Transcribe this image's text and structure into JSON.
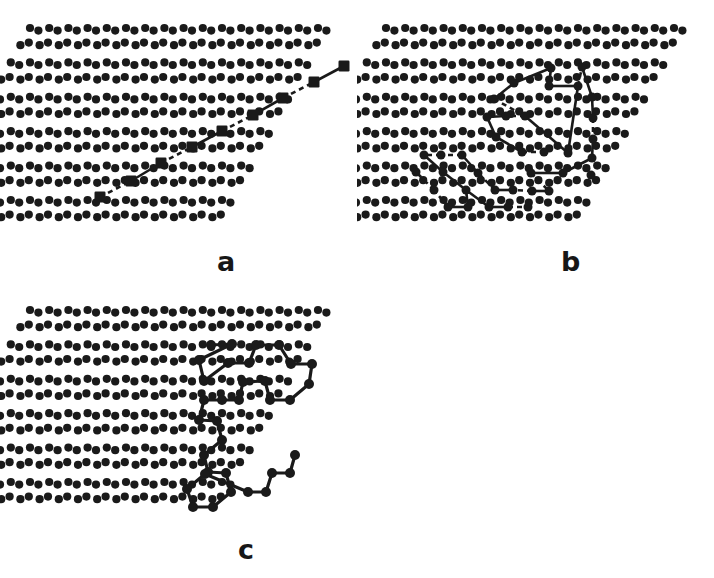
{
  "figure": {
    "background_color": "#ffffff",
    "ink_color": "#1a1a1a",
    "width": 714,
    "height": 578,
    "panel_count": 3
  },
  "lattice": {
    "type": "honeycomb-paired-dot",
    "dot_radius": 4.1,
    "row_spacing": 17.2,
    "column_spacing": 19.2,
    "shear_per_row": -9.6,
    "dot_color": "#1a1a1a"
  },
  "panels": [
    {
      "id": "a",
      "label": "a",
      "label_x": 217,
      "label_y": 248,
      "origin_x": 30,
      "origin_y": 28,
      "rows": 12,
      "cols": 16,
      "description": "Straight diagonal chain of square sites (rod-like conformation)",
      "marker_shape": "square",
      "marker_size": 11,
      "bond_pattern": "alternating-solid-dashed",
      "chain_site_count": 9,
      "chain_points": [
        [
          100,
          197
        ],
        [
          131,
          181
        ],
        [
          161,
          163
        ],
        [
          192,
          147
        ],
        [
          222,
          131
        ],
        [
          253,
          115
        ],
        [
          283,
          98
        ],
        [
          314,
          82
        ],
        [
          344,
          66
        ]
      ],
      "bond_styles": [
        "dashed",
        "solid",
        "dashed",
        "solid",
        "dashed",
        "solid",
        "dashed",
        "solid"
      ]
    },
    {
      "id": "b",
      "label": "b",
      "label_x": 561,
      "label_y": 248,
      "origin_x": 386,
      "origin_y": 28,
      "rows": 12,
      "cols": 16,
      "description": "Compact collapsed cluster: several closed loops of occupied sites with mixed solid and dashed bonds",
      "marker_shape": "circle",
      "marker_size": 9,
      "bond_pattern": "mixed-solid-dashed",
      "chain_site_count": 38,
      "nodes": [
        [
          551,
          68
        ],
        [
          514,
          83
        ],
        [
          494,
          99
        ],
        [
          549,
          86
        ],
        [
          578,
          86
        ],
        [
          582,
          67
        ],
        [
          592,
          97
        ],
        [
          593,
          118
        ],
        [
          593,
          139
        ],
        [
          592,
          158
        ],
        [
          591,
          175
        ],
        [
          568,
          153
        ],
        [
          548,
          133
        ],
        [
          525,
          116
        ],
        [
          506,
          116
        ],
        [
          487,
          117
        ],
        [
          496,
          137
        ],
        [
          522,
          152
        ],
        [
          544,
          152
        ],
        [
          563,
          173
        ],
        [
          531,
          173
        ],
        [
          549,
          191
        ],
        [
          532,
          191
        ],
        [
          513,
          190
        ],
        [
          495,
          190
        ],
        [
          478,
          173
        ],
        [
          462,
          155
        ],
        [
          441,
          155
        ],
        [
          424,
          155
        ],
        [
          443,
          172
        ],
        [
          466,
          190
        ],
        [
          489,
          207
        ],
        [
          508,
          207
        ],
        [
          528,
          207
        ],
        [
          468,
          207
        ],
        [
          448,
          207
        ],
        [
          434,
          190
        ],
        [
          416,
          172
        ]
      ],
      "edges": [
        {
          "from": 0,
          "to": 1,
          "style": "solid"
        },
        {
          "from": 1,
          "to": 2,
          "style": "solid"
        },
        {
          "from": 0,
          "to": 3,
          "style": "solid"
        },
        {
          "from": 3,
          "to": 4,
          "style": "solid"
        },
        {
          "from": 4,
          "to": 5,
          "style": "dashed"
        },
        {
          "from": 5,
          "to": 6,
          "style": "solid"
        },
        {
          "from": 6,
          "to": 7,
          "style": "solid"
        },
        {
          "from": 7,
          "to": 8,
          "style": "dashed"
        },
        {
          "from": 8,
          "to": 9,
          "style": "solid"
        },
        {
          "from": 2,
          "to": 13,
          "style": "dashed"
        },
        {
          "from": 13,
          "to": 11,
          "style": "solid"
        },
        {
          "from": 11,
          "to": 4,
          "style": "solid"
        },
        {
          "from": 13,
          "to": 14,
          "style": "dashed"
        },
        {
          "from": 14,
          "to": 15,
          "style": "solid"
        },
        {
          "from": 15,
          "to": 16,
          "style": "solid"
        },
        {
          "from": 16,
          "to": 17,
          "style": "solid"
        },
        {
          "from": 17,
          "to": 18,
          "style": "dashed"
        },
        {
          "from": 9,
          "to": 19,
          "style": "solid"
        },
        {
          "from": 19,
          "to": 20,
          "style": "solid"
        },
        {
          "from": 20,
          "to": 21,
          "style": "dashed"
        },
        {
          "from": 21,
          "to": 22,
          "style": "solid"
        },
        {
          "from": 22,
          "to": 23,
          "style": "dashed"
        },
        {
          "from": 23,
          "to": 24,
          "style": "solid"
        },
        {
          "from": 24,
          "to": 25,
          "style": "dashed"
        },
        {
          "from": 25,
          "to": 26,
          "style": "solid"
        },
        {
          "from": 26,
          "to": 27,
          "style": "dashed"
        },
        {
          "from": 27,
          "to": 28,
          "style": "dashed"
        },
        {
          "from": 28,
          "to": 29,
          "style": "solid"
        },
        {
          "from": 29,
          "to": 30,
          "style": "solid"
        },
        {
          "from": 30,
          "to": 31,
          "style": "solid"
        },
        {
          "from": 31,
          "to": 32,
          "style": "solid"
        },
        {
          "from": 32,
          "to": 33,
          "style": "dashed"
        },
        {
          "from": 30,
          "to": 34,
          "style": "solid"
        },
        {
          "from": 34,
          "to": 35,
          "style": "solid"
        },
        {
          "from": 35,
          "to": 36,
          "style": "dashed"
        },
        {
          "from": 36,
          "to": 37,
          "style": "dashed"
        }
      ]
    },
    {
      "id": "c",
      "label": "c",
      "label_x": 238,
      "label_y": 536,
      "origin_x": 30,
      "origin_y": 310,
      "rows": 12,
      "cols": 16,
      "description": "Extended self-avoiding walk: single long chain of occupied sites with solid bonds",
      "marker_shape": "circle",
      "marker_size": 10,
      "bond_pattern": "solid",
      "chain_site_count": 34,
      "path_points": [
        [
          211,
          345
        ],
        [
          232,
          344
        ],
        [
          199,
          360
        ],
        [
          204,
          381
        ],
        [
          228,
          363
        ],
        [
          249,
          363
        ],
        [
          256,
          345
        ],
        [
          279,
          345
        ],
        [
          291,
          364
        ],
        [
          312,
          364
        ],
        [
          309,
          384
        ],
        [
          290,
          400
        ],
        [
          270,
          400
        ],
        [
          265,
          381
        ],
        [
          243,
          382
        ],
        [
          239,
          400
        ],
        [
          222,
          400
        ],
        [
          204,
          400
        ],
        [
          199,
          420
        ],
        [
          217,
          421
        ],
        [
          222,
          440
        ],
        [
          204,
          455
        ],
        [
          208,
          472
        ],
        [
          226,
          473
        ],
        [
          231,
          492
        ],
        [
          213,
          507
        ],
        [
          193,
          507
        ],
        [
          187,
          489
        ],
        [
          205,
          474
        ],
        [
          248,
          492
        ],
        [
          266,
          492
        ],
        [
          272,
          473
        ],
        [
          290,
          473
        ],
        [
          295,
          455
        ]
      ]
    }
  ]
}
